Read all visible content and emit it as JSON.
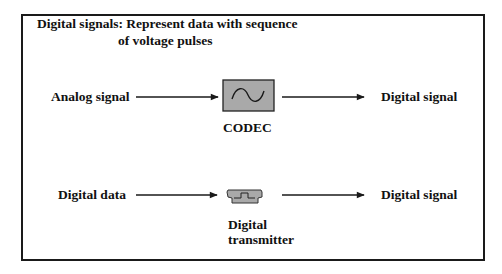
{
  "diagram": {
    "title_line1": "Digital signals: Represent data with sequence",
    "title_line2": "of voltage pulses",
    "rows": [
      {
        "input_label": "Analog signal",
        "device_label": "CODEC",
        "device_icon": "sine-wave-icon",
        "output_label": "Digital signal"
      },
      {
        "input_label": "Digital data",
        "device_label_line1": "Digital",
        "device_label_line2": "transmitter",
        "device_icon": "pulse-icon",
        "output_label": "Digital signal"
      }
    ],
    "colors": {
      "line": "#1a1a1a",
      "device_fill": "#a9a9a9"
    }
  }
}
